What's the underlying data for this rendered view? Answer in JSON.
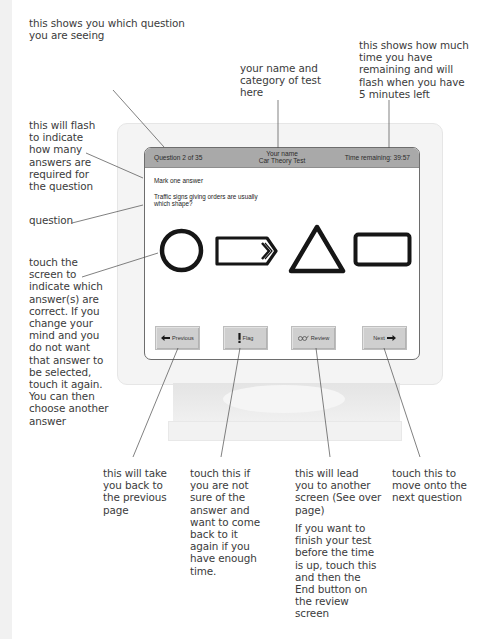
{
  "annotations": {
    "question_number": "this shows you which question\nyou are seeing",
    "candidate_info": "your name and\ncategory of test\nhere",
    "time_remaining": "this shows how much\ntime you have\nremaining and will\nflash when you have\n5 minutes left",
    "mark_count": "this will flash\nto indicate\nhow many\nanswers are\nrequired for\nthe question",
    "question": "question",
    "touch_answer": "touch the\nscreen to\nindicate which\nanswer(s) are\ncorrect. If you\nchange your\nmind and you\ndo not want\nthat answer to\nbe selected,\ntouch it again.\nYou can then\nchoose another\nanswer",
    "previous": "this will take\nyou back to\nthe previous\npage",
    "flag": "touch this if\nyou are not\nsure of the\nanswer and\nwant to come\nback to it\nagain if you\nhave enough\ntime.",
    "review_1": "this will lead\nyou  to another\nscreen (See over\npage)",
    "review_2": "If you want to\nfinish your test\nbefore the time\nis up, touch this\nand then the\nEnd button on\nthe review\nscreen",
    "next": "touch this to\nmove onto the\nnext question"
  },
  "screen": {
    "header": {
      "question_counter": "Question 2 of 35",
      "candidate_name": "Your name",
      "test_category": "Car Theory Test",
      "time_remaining": "Time remaining: 39:57"
    },
    "instruction": "Mark one answer",
    "question_text": "Traffic signs giving orders are usually which shape?",
    "answers": [
      {
        "shape": "circle"
      },
      {
        "shape": "arrow-pointed-rectangle"
      },
      {
        "shape": "triangle"
      },
      {
        "shape": "rectangle"
      }
    ],
    "buttons": {
      "previous": {
        "label": "Previous",
        "icon": "arrow-left-icon"
      },
      "flag": {
        "label": "Flag",
        "icon": "exclamation-icon"
      },
      "review": {
        "label": "Review",
        "icon": "glasses-icon"
      },
      "next": {
        "label": "Next",
        "icon": "arrow-right-icon"
      }
    }
  },
  "colors": {
    "header_bar": "#a9a9a9",
    "button_face": "#cfcfcf",
    "bezel": "#f4f4f4",
    "annotation_text": "#3b3b3b"
  }
}
